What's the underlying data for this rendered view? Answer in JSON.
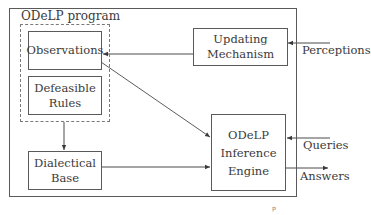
{
  "diagram": {
    "container_label": "ODeLP program",
    "nodes": {
      "observations": {
        "lines": [
          "Observations"
        ]
      },
      "defeasible_rules": {
        "lines": [
          "Defeasible",
          "Rules"
        ]
      },
      "updating_mechanism": {
        "lines": [
          "Updating",
          "Mechanism"
        ]
      },
      "dialectical_base": {
        "lines": [
          "Dialectical",
          "Base"
        ]
      },
      "inference_engine": {
        "lines": [
          "ODeLP",
          "Inference",
          "Engine"
        ]
      }
    },
    "external_labels": {
      "perceptions": "Perceptions",
      "queries": "Queries",
      "answers": "Answers"
    },
    "edges": [
      {
        "from": "perceptions",
        "to": "updating_mechanism"
      },
      {
        "from": "updating_mechanism",
        "to": "observations"
      },
      {
        "from": "observations",
        "to": "inference_engine"
      },
      {
        "from": "defeasible_rules",
        "to": "dialectical_base"
      },
      {
        "from": "dialectical_base",
        "to": "inference_engine"
      },
      {
        "from": "queries",
        "to": "inference_engine"
      },
      {
        "from": "inference_engine",
        "to": "answers"
      }
    ],
    "stray_mark": "p"
  }
}
